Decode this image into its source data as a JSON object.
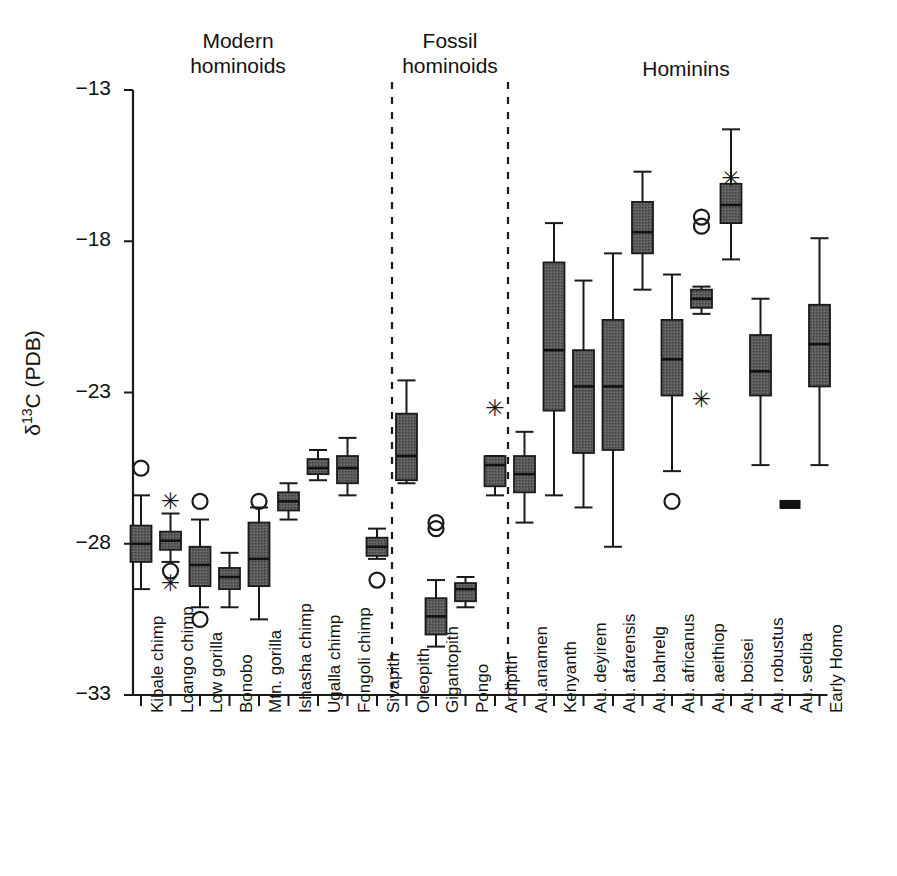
{
  "chart_data": {
    "type": "box",
    "title": "",
    "xlabel": "",
    "ylabel": "δ13C (PDB)",
    "ylabel_base": "δ",
    "ylabel_sup": "13",
    "ylabel_rest": "C (PDB)",
    "ylim": [
      -33,
      -13
    ],
    "yticks": [
      -13,
      -18,
      -23,
      -28,
      -33
    ],
    "ytick_labels": [
      "−13",
      "−18",
      "−23",
      "−28",
      "−33"
    ],
    "grid": false,
    "legend": "none",
    "group_headers": [
      {
        "label": "Modern\nhominoids",
        "center_x": 238,
        "top": 28
      },
      {
        "label": "Fossil\nhominoids",
        "center_x": 450,
        "top": 28
      },
      {
        "label": "Hominins",
        "center_x": 686,
        "top": 56
      }
    ],
    "separators_x": [
      392,
      508
    ],
    "categories": [
      "Kibale chimp",
      "Loango chimp",
      "Low gorilla",
      "Bonobo",
      "Mtn. gorilla",
      "Ishasha chimp",
      "Ugalla chimp",
      "Fongoli chimp",
      "Sivapith",
      "Oreopith",
      "Gigantopith",
      "Pongo",
      "Ardipith",
      "Au.anamen",
      "Kenyanth",
      "Au. deyirem",
      "Au. afarensis",
      "Au. bahrelg",
      "Au. africanus",
      "Au. aeithiop",
      "Au. boisei",
      "Au. robustus",
      "Au. sediba",
      "Early Homo"
    ],
    "boxes": [
      {
        "name": "Kibale chimp",
        "group": "modern",
        "whisker_low": -29.5,
        "q1": -28.6,
        "median": -28.0,
        "q3": -27.4,
        "whisker_high": -26.4,
        "outliers": [
          -25.5
        ],
        "stars": []
      },
      {
        "name": "Loango chimp",
        "group": "modern",
        "whisker_low": -28.6,
        "q1": -28.2,
        "median": -27.9,
        "q3": -27.6,
        "whisker_high": -27.0,
        "outliers": [
          -28.9
        ],
        "stars": [
          -26.6,
          -29.3
        ]
      },
      {
        "name": "Low gorilla",
        "group": "modern",
        "whisker_low": -30.1,
        "q1": -29.4,
        "median": -28.7,
        "q3": -28.1,
        "whisker_high": -27.2,
        "outliers": [
          -26.6,
          -30.5
        ],
        "stars": []
      },
      {
        "name": "Bonobo",
        "group": "modern",
        "whisker_low": -30.1,
        "q1": -29.5,
        "median": -29.1,
        "q3": -28.8,
        "whisker_high": -28.3,
        "outliers": [],
        "stars": []
      },
      {
        "name": "Mtn. gorilla",
        "group": "modern",
        "whisker_low": -30.5,
        "q1": -29.4,
        "median": -28.5,
        "q3": -27.3,
        "whisker_high": -26.8,
        "outliers": [
          -26.6
        ],
        "stars": []
      },
      {
        "name": "Ishasha chimp",
        "group": "modern",
        "whisker_low": -27.2,
        "q1": -26.9,
        "median": -26.6,
        "q3": -26.3,
        "whisker_high": -26.0,
        "outliers": [],
        "stars": []
      },
      {
        "name": "Ugalla chimp",
        "group": "modern",
        "whisker_low": -25.9,
        "q1": -25.7,
        "median": -25.5,
        "q3": -25.2,
        "whisker_high": -24.9,
        "outliers": [],
        "stars": []
      },
      {
        "name": "Fongoli chimp",
        "group": "modern",
        "whisker_low": -26.4,
        "q1": -26.0,
        "median": -25.5,
        "q3": -25.1,
        "whisker_high": -24.5,
        "outliers": [],
        "stars": []
      },
      {
        "name": "Sivapith",
        "group": "fossil",
        "whisker_low": -28.5,
        "q1": -28.4,
        "median": -28.1,
        "q3": -27.8,
        "whisker_high": -27.5,
        "outliers": [
          -29.2
        ],
        "stars": []
      },
      {
        "name": "Oreopith",
        "group": "fossil",
        "whisker_low": -26.0,
        "q1": -25.9,
        "median": -25.1,
        "q3": -23.7,
        "whisker_high": -22.6,
        "outliers": [],
        "stars": []
      },
      {
        "name": "Gigantopith",
        "group": "fossil",
        "whisker_low": -31.4,
        "q1": -31.0,
        "median": -30.4,
        "q3": -29.8,
        "whisker_high": -29.2,
        "outliers": [
          -27.3,
          -27.5
        ],
        "stars": []
      },
      {
        "name": "Pongo",
        "group": "fossil",
        "whisker_low": -30.1,
        "q1": -29.9,
        "median": -29.5,
        "q3": -29.3,
        "whisker_high": -29.1,
        "outliers": [],
        "stars": []
      },
      {
        "name": "Ardipith",
        "group": "hominin",
        "whisker_low": -26.4,
        "q1": -26.1,
        "median": -25.4,
        "q3": -25.1,
        "whisker_high": -25.1,
        "outliers": [],
        "stars": [
          -23.5
        ]
      },
      {
        "name": "Au.anamen",
        "group": "hominin",
        "whisker_low": -27.3,
        "q1": -26.3,
        "median": -25.7,
        "q3": -25.1,
        "whisker_high": -24.3,
        "outliers": [],
        "stars": []
      },
      {
        "name": "Kenyanth",
        "group": "hominin",
        "whisker_low": -26.4,
        "q1": -23.6,
        "median": -21.6,
        "q3": -18.7,
        "whisker_high": -17.4,
        "outliers": [],
        "stars": []
      },
      {
        "name": "Au. deyirem",
        "group": "hominin",
        "whisker_low": -26.8,
        "q1": -25.0,
        "median": -22.8,
        "q3": -21.6,
        "whisker_high": -19.3,
        "outliers": [],
        "stars": []
      },
      {
        "name": "Au. afarensis",
        "group": "hominin",
        "whisker_low": -28.1,
        "q1": -24.9,
        "median": -22.8,
        "q3": -20.6,
        "whisker_high": -18.4,
        "outliers": [],
        "stars": []
      },
      {
        "name": "Au. bahrelg",
        "group": "hominin",
        "whisker_low": -19.6,
        "q1": -18.4,
        "median": -17.7,
        "q3": -16.7,
        "whisker_high": -15.7,
        "outliers": [],
        "stars": []
      },
      {
        "name": "Au. africanus",
        "group": "hominin",
        "whisker_low": -25.6,
        "q1": -23.1,
        "median": -21.9,
        "q3": -20.6,
        "whisker_high": -19.1,
        "outliers": [
          -26.6
        ],
        "stars": []
      },
      {
        "name": "Au. aeithiop",
        "group": "hominin",
        "whisker_low": -20.4,
        "q1": -20.2,
        "median": -19.9,
        "q3": -19.6,
        "whisker_high": -19.5,
        "outliers": [
          -17.2,
          -17.5
        ],
        "stars": [
          -23.2
        ]
      },
      {
        "name": "Au. boisei",
        "group": "hominin",
        "whisker_low": -18.6,
        "q1": -17.4,
        "median": -16.8,
        "q3": -16.1,
        "whisker_high": -14.3,
        "outliers": [],
        "stars": [
          -15.9
        ]
      },
      {
        "name": "Au. robustus",
        "group": "hominin",
        "whisker_low": -25.4,
        "q1": -23.1,
        "median": -22.3,
        "q3": -21.1,
        "whisker_high": -19.9,
        "outliers": [],
        "stars": []
      },
      {
        "name": "Au. sediba",
        "group": "hominin",
        "whisker_low": -26.7,
        "q1": -26.7,
        "median": -26.7,
        "q3": -26.7,
        "whisker_high": -26.7,
        "outliers": [],
        "stars": [],
        "single_marker": true
      },
      {
        "name": "Early Homo",
        "group": "hominin",
        "whisker_low": -25.4,
        "q1": -22.8,
        "median": -21.4,
        "q3": -20.1,
        "whisker_high": -17.9,
        "outliers": [],
        "stars": []
      }
    ],
    "colors": {
      "box_fill": "#5a5a5a",
      "box_stroke": "#1a1a1a",
      "axis": "#1a1a1a",
      "text": "#111111"
    }
  }
}
